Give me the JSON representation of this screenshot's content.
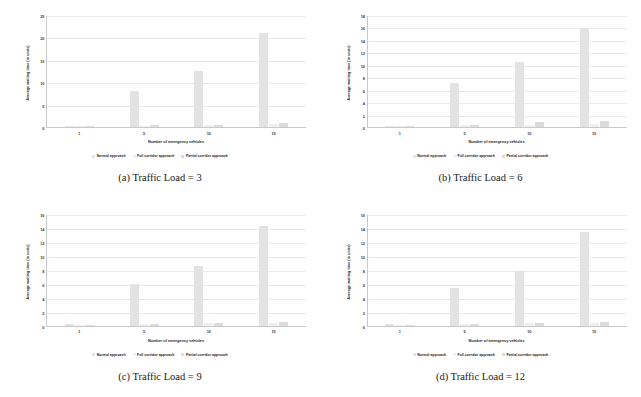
{
  "figure": {
    "legend": [
      {
        "label": "Normal approach",
        "color": "#e3e3e3"
      },
      {
        "label": "Full corridor approach",
        "color": "#efefef"
      },
      {
        "label": "Partial corridor approach",
        "color": "#dcdcdc"
      }
    ],
    "axis": {
      "xlabel": "Number of emergency vehicles",
      "ylabel": "Average waiting time (in units)"
    }
  },
  "chart_data": [
    {
      "type": "bar",
      "panel": "a",
      "caption": "(a)  Traffic Load = 3",
      "title": "",
      "xlabel": "Number of emergency vehicles",
      "ylabel": "Average waiting time (in units)",
      "categories": [
        "1",
        "5",
        "10",
        "15"
      ],
      "yticks": [
        0,
        5,
        10,
        15,
        20,
        25
      ],
      "ylim": [
        0,
        25
      ],
      "grid": true,
      "legend_position": "bottom",
      "series": [
        {
          "name": "Normal approach",
          "color": "#e3e3e3",
          "values": [
            0.2,
            8.1,
            12.6,
            21.0
          ]
        },
        {
          "name": "Full corridor approach",
          "color": "#efefef",
          "values": [
            0.1,
            0.3,
            0.45,
            0.6
          ]
        },
        {
          "name": "Partial corridor approach",
          "color": "#dcdcdc",
          "values": [
            0.1,
            0.35,
            0.5,
            1.0
          ]
        }
      ]
    },
    {
      "type": "bar",
      "panel": "b",
      "caption": "(b)  Traffic Load = 6",
      "title": "",
      "xlabel": "Number of emergency vehicles",
      "ylabel": "Average waiting time (in units)",
      "categories": [
        "1",
        "5",
        "10",
        "15"
      ],
      "yticks": [
        0,
        2,
        4,
        6,
        8,
        10,
        12,
        14,
        16,
        18
      ],
      "ylim": [
        0,
        18
      ],
      "grid": true,
      "legend_position": "bottom",
      "series": [
        {
          "name": "Normal approach",
          "color": "#e3e3e3",
          "values": [
            0.15,
            7.0,
            10.4,
            15.9
          ]
        },
        {
          "name": "Full corridor approach",
          "color": "#efefef",
          "values": [
            0.1,
            0.25,
            0.4,
            0.5
          ]
        },
        {
          "name": "Partial corridor approach",
          "color": "#dcdcdc",
          "values": [
            0.1,
            0.3,
            0.8,
            0.9
          ]
        }
      ]
    },
    {
      "type": "bar",
      "panel": "c",
      "caption": "(c)  Traffic Load = 9",
      "title": "",
      "xlabel": "Number of emergency vehicles",
      "ylabel": "Average waiting time (in units)",
      "categories": [
        "1",
        "5",
        "10",
        "15"
      ],
      "yticks": [
        0,
        2,
        4,
        6,
        8,
        10,
        12,
        14,
        16
      ],
      "ylim": [
        0,
        16
      ],
      "grid": true,
      "legend_position": "bottom",
      "series": [
        {
          "name": "Normal approach",
          "color": "#e3e3e3",
          "values": [
            0.2,
            6.0,
            8.5,
            14.2
          ]
        },
        {
          "name": "Full corridor approach",
          "color": "#efefef",
          "values": [
            0.1,
            0.2,
            0.3,
            0.4
          ]
        },
        {
          "name": "Partial corridor approach",
          "color": "#dcdcdc",
          "values": [
            0.1,
            0.25,
            0.4,
            0.5
          ]
        }
      ]
    },
    {
      "type": "bar",
      "panel": "d",
      "caption": "(d)  Traffic Load = 12",
      "title": "",
      "xlabel": "Number of emergency vehicles",
      "ylabel": "Average waiting time (in units)",
      "categories": [
        "1",
        "5",
        "10",
        "15"
      ],
      "yticks": [
        0,
        2,
        4,
        6,
        8,
        10,
        12,
        14,
        16
      ],
      "ylim": [
        0,
        16
      ],
      "grid": true,
      "legend_position": "bottom",
      "series": [
        {
          "name": "Normal approach",
          "color": "#e3e3e3",
          "values": [
            0.2,
            5.3,
            7.8,
            13.3
          ]
        },
        {
          "name": "Full corridor approach",
          "color": "#efefef",
          "values": [
            0.1,
            0.2,
            0.3,
            0.35
          ]
        },
        {
          "name": "Partial corridor approach",
          "color": "#dcdcdc",
          "values": [
            0.1,
            0.22,
            0.35,
            0.45
          ]
        }
      ]
    }
  ]
}
